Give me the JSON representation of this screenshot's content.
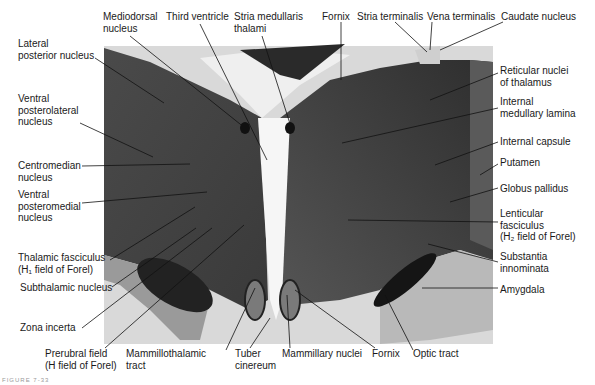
{
  "figure": {
    "caption": "FIGURE 7-33",
    "type": "coronal brain section (histological, myelin stain)"
  },
  "labels_top": [
    {
      "id": "mediodorsal",
      "text": "Mediodorsal\nnucleus",
      "x": 103,
      "y": 11
    },
    {
      "id": "third-ventricle",
      "text": "Third ventricle",
      "x": 166,
      "y": 11
    },
    {
      "id": "stria-medullaris",
      "text": "Stria medullaris\nthalami",
      "x": 234,
      "y": 11
    },
    {
      "id": "fornix-top",
      "text": "Fornix",
      "x": 322,
      "y": 11
    },
    {
      "id": "stria-terminalis",
      "text": "Stria terminalis",
      "x": 357,
      "y": 11
    },
    {
      "id": "vena-terminalis",
      "text": "Vena terminalis",
      "x": 427,
      "y": 11
    },
    {
      "id": "caudate",
      "text": "Caudate nucleus",
      "x": 501,
      "y": 11
    }
  ],
  "labels_left": [
    {
      "id": "lateral-posterior",
      "text": "Lateral\nposterior nucleus",
      "x": 18,
      "y": 38
    },
    {
      "id": "vpl",
      "text": "Ventral\nposterolateral\nnucleus",
      "x": 18,
      "y": 93
    },
    {
      "id": "centromedian",
      "text": "Centromedian\nnucleus",
      "x": 18,
      "y": 160
    },
    {
      "id": "vpm",
      "text": "Ventral\nposteromedial\nnucleus",
      "x": 18,
      "y": 189
    },
    {
      "id": "thalamic-fasciculus",
      "text": "Thalamic fasciculus\n(H₁ field of Forel)",
      "x": 18,
      "y": 252
    },
    {
      "id": "subthalamic",
      "text": "Subthalamic nucleus",
      "x": 20,
      "y": 282
    },
    {
      "id": "zona-incerta",
      "text": "Zona incerta",
      "x": 20,
      "y": 322
    },
    {
      "id": "prerubral",
      "text": "Prerubral field\n(H field of Forel)",
      "x": 45,
      "y": 348
    },
    {
      "id": "mammillothalamic",
      "text": "Mammillothalamic\ntract",
      "x": 126,
      "y": 348
    },
    {
      "id": "tuber-cinereum",
      "text": "Tuber\ncinereum",
      "x": 235,
      "y": 348
    }
  ],
  "labels_right": [
    {
      "id": "reticular",
      "text": "Reticular nuclei\nof thalamus",
      "x": 500,
      "y": 65
    },
    {
      "id": "internal-medullary",
      "text": "Internal\nmedullary lamina",
      "x": 500,
      "y": 96
    },
    {
      "id": "internal-capsule",
      "text": "Internal capsule",
      "x": 500,
      "y": 136
    },
    {
      "id": "putamen",
      "text": "Putamen",
      "x": 500,
      "y": 157
    },
    {
      "id": "globus-pallidus",
      "text": "Globus pallidus",
      "x": 500,
      "y": 183
    },
    {
      "id": "lenticular-fasciculus",
      "text": "Lenticular\nfasciculus\n(H₂ field of Forel)",
      "x": 500,
      "y": 208
    },
    {
      "id": "substantia-innominata",
      "text": "Substantia\ninnominata",
      "x": 500,
      "y": 251
    },
    {
      "id": "amygdala",
      "text": "Amygdala",
      "x": 500,
      "y": 284
    }
  ],
  "labels_bottom": [
    {
      "id": "mammillary-nuclei",
      "text": "Mammillary nuclei",
      "x": 282,
      "y": 348
    },
    {
      "id": "fornix-bottom",
      "text": "Fornix",
      "x": 372,
      "y": 348
    },
    {
      "id": "optic-tract",
      "text": "Optic tract",
      "x": 413,
      "y": 348
    }
  ]
}
